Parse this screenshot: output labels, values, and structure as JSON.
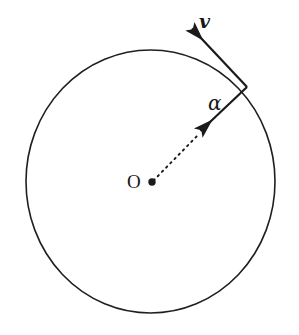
{
  "figure": {
    "type": "geometry-diagram",
    "background_color": "#ffffff",
    "stroke_color": "#1a1a1a",
    "canvas": {
      "width": 299,
      "height": 335
    },
    "circle": {
      "name": "main-circle",
      "center_x": 150.5,
      "center_y": 181.5,
      "radius_x": 124.5,
      "radius_y": 131.5,
      "stroke_width": 1.6,
      "fill": "none"
    },
    "center_point": {
      "name": "center-point",
      "x": 152,
      "y": 182,
      "radius": 3.6
    },
    "radius_line": {
      "name": "radius-dashed-line",
      "x1": 153,
      "y1": 181,
      "x2": 198,
      "y2": 135,
      "style": "dashed",
      "dash_pattern": "2 4",
      "stroke_width": 1.8
    },
    "inward_arrow": {
      "name": "inward-radius-arrow",
      "x1": 247,
      "y1": 87,
      "x2": 196,
      "y2": 135,
      "stroke_width": 2.2,
      "arrowhead_at": "end"
    },
    "velocity_arrow": {
      "name": "velocity-vector-arrow",
      "x1": 247,
      "y1": 87,
      "x2": 188,
      "y2": 24,
      "stroke_width": 2.2,
      "arrowhead_at": "end"
    },
    "vertex_point": {
      "name": "circumference-vertex",
      "x": 247,
      "y": 87
    },
    "labels": {
      "velocity": "v",
      "angle": "α",
      "center": "O"
    }
  }
}
